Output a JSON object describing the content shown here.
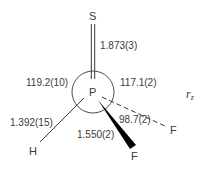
{
  "diagram": {
    "molecule": "SPHF2",
    "method_label": {
      "symbol": "r",
      "subscript": "z"
    },
    "atoms": {
      "S": "S",
      "P": "P",
      "H": "H",
      "F_wedge": "F",
      "F_dash": "F"
    },
    "bond_lengths": {
      "P=S": "1.873(3)",
      "P-H": "1.392(15)",
      "P-F": "1.550(2)"
    },
    "bond_angles": {
      "S=P-H": "119.2(10)",
      "S=P-F": "117.1(2)",
      "F-P-F": "98.7(2)"
    },
    "colors": {
      "ink": "#3a3a3a",
      "wedge": "#000000",
      "background": "#ffffff"
    }
  }
}
